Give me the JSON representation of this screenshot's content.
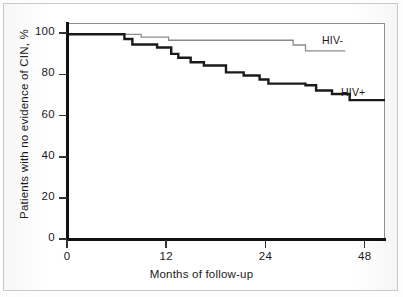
{
  "chart_data": {
    "type": "line",
    "subtype": "kaplan-meier-step",
    "title": "",
    "xlabel": "Months of follow-up",
    "ylabel": "Patients with no evidence of CIN, %",
    "xlim": [
      0,
      36
    ],
    "ylim": [
      0,
      105
    ],
    "xticks": [
      0,
      12,
      24,
      48
    ],
    "xtick_labels": [
      "0",
      "12",
      "24",
      "48"
    ],
    "yticks": [
      0,
      20,
      40,
      60,
      80,
      100
    ],
    "ytick_labels": [
      "0",
      "20",
      "40",
      "60",
      "80",
      "100"
    ],
    "grid": false,
    "legend_position": "inline-right",
    "series": [
      {
        "name": "HIV-",
        "label": "HIV-",
        "color": "#8a8a8a",
        "line_width": 1.3,
        "style": "step",
        "annotation": "HIV-",
        "points": [
          {
            "x": 0.0,
            "y": 100.0
          },
          {
            "x": 8.4,
            "y": 100.0
          },
          {
            "x": 8.4,
            "y": 98.6
          },
          {
            "x": 11.5,
            "y": 98.6
          },
          {
            "x": 11.5,
            "y": 97.1
          },
          {
            "x": 25.6,
            "y": 97.1
          },
          {
            "x": 25.6,
            "y": 94.8
          },
          {
            "x": 27.0,
            "y": 94.8
          },
          {
            "x": 27.0,
            "y": 91.9
          },
          {
            "x": 31.5,
            "y": 91.9
          }
        ]
      },
      {
        "name": "HIV+",
        "label": "HIV+",
        "color": "#1a1a1a",
        "line_width": 2.4,
        "style": "step",
        "annotation": "HIV+",
        "points": [
          {
            "x": 0.0,
            "y": 100.0
          },
          {
            "x": 6.5,
            "y": 100.0
          },
          {
            "x": 6.5,
            "y": 97.7
          },
          {
            "x": 7.4,
            "y": 97.7
          },
          {
            "x": 7.4,
            "y": 95.0
          },
          {
            "x": 10.2,
            "y": 95.0
          },
          {
            "x": 10.2,
            "y": 93.6
          },
          {
            "x": 11.8,
            "y": 93.6
          },
          {
            "x": 11.8,
            "y": 90.5
          },
          {
            "x": 12.6,
            "y": 90.5
          },
          {
            "x": 12.6,
            "y": 88.6
          },
          {
            "x": 14.0,
            "y": 88.6
          },
          {
            "x": 14.0,
            "y": 86.4
          },
          {
            "x": 15.5,
            "y": 86.4
          },
          {
            "x": 15.5,
            "y": 84.8
          },
          {
            "x": 18.0,
            "y": 84.8
          },
          {
            "x": 18.0,
            "y": 81.5
          },
          {
            "x": 20.0,
            "y": 81.5
          },
          {
            "x": 20.0,
            "y": 80.0
          },
          {
            "x": 21.8,
            "y": 80.0
          },
          {
            "x": 21.8,
            "y": 78.0
          },
          {
            "x": 22.8,
            "y": 78.0
          },
          {
            "x": 22.8,
            "y": 76.0
          },
          {
            "x": 27.0,
            "y": 76.0
          },
          {
            "x": 27.0,
            "y": 75.2
          },
          {
            "x": 28.2,
            "y": 75.2
          },
          {
            "x": 28.2,
            "y": 72.7
          },
          {
            "x": 30.0,
            "y": 72.7
          },
          {
            "x": 30.0,
            "y": 71.0
          },
          {
            "x": 32.0,
            "y": 71.0
          },
          {
            "x": 32.0,
            "y": 68.0
          },
          {
            "x": 36.0,
            "y": 68.0
          }
        ]
      }
    ]
  },
  "axes": {
    "ylabel": "Patients with no evidence of CIN, %",
    "xlabel": "Months of follow-up",
    "ytick_labels": [
      "100",
      "80",
      "60",
      "40",
      "20",
      "0"
    ],
    "xtick_labels": [
      "0",
      "12",
      "24",
      "48"
    ]
  },
  "annotations": {
    "hiv_negative": "HIV-",
    "hiv_positive": "HIV+"
  },
  "colors": {
    "hiv_negative_line": "#8a8a8a",
    "hiv_positive_line": "#1a1a1a",
    "axis": "#111111",
    "frame": "#8e8e8e",
    "background": "#ffffff"
  }
}
